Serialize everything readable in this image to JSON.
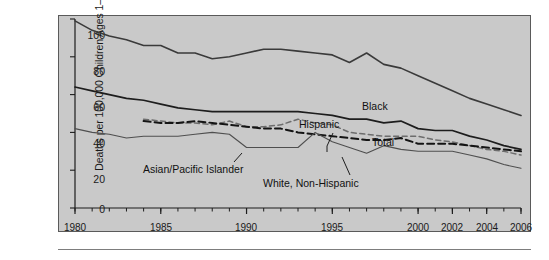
{
  "figure": {
    "background_color": "#c9c9c9",
    "border_color": "#5a5a5a",
    "rule_color": "#7d7d7d"
  },
  "axes": {
    "ylabel": "Deaths per 100,000 Children Ages 1–4",
    "yticks": [
      "0",
      "20",
      "40",
      "60",
      "80",
      "100"
    ],
    "xticks": [
      "1980",
      "1985",
      "1990",
      "1995",
      "2000",
      "2002",
      "2004",
      "2006"
    ]
  },
  "annotations": {
    "black": "Black",
    "hispanic": "Hispanic",
    "total": "Total",
    "asian_pacific_islander": "Asian/Pacific Islander",
    "white_non_hispanic": "White, Non-Hispanic"
  },
  "chart_data": {
    "type": "line",
    "title": "",
    "xlabel": "",
    "ylabel": "Deaths per 100,000 Children Ages 1–4",
    "xlim": [
      1980,
      2006
    ],
    "ylim": [
      0,
      100
    ],
    "xticks": [
      1980,
      1985,
      1990,
      1995,
      2000,
      2002,
      2004,
      2006
    ],
    "yticks": [
      0,
      20,
      40,
      60,
      80,
      100
    ],
    "xtick_minor_step": 1,
    "grid": false,
    "legend_position": "inline-annotations",
    "series": [
      {
        "name": "Black",
        "style": "solid",
        "color": "#3a3a3a",
        "width": 1.6,
        "x": [
          1980,
          1981,
          1982,
          1983,
          1984,
          1985,
          1986,
          1987,
          1988,
          1989,
          1990,
          1991,
          1992,
          1993,
          1994,
          1995,
          1996,
          1997,
          1998,
          1999,
          2000,
          2001,
          2002,
          2003,
          2004,
          2005,
          2006
        ],
        "values": [
          99,
          94,
          91,
          89,
          86,
          86,
          82,
          82,
          79,
          80,
          82,
          84,
          84,
          83,
          82,
          81,
          77,
          82,
          76,
          74,
          70,
          66,
          62,
          58,
          55,
          52,
          49
        ]
      },
      {
        "name": "Total",
        "style": "solid",
        "color": "#1d1d1d",
        "width": 1.7,
        "x": [
          1980,
          1981,
          1982,
          1983,
          1984,
          1985,
          1986,
          1987,
          1988,
          1989,
          1990,
          1991,
          1992,
          1993,
          1994,
          1995,
          1996,
          1997,
          1998,
          1999,
          2000,
          2001,
          2002,
          2003,
          2004,
          2005,
          2006
        ],
        "values": [
          64,
          62,
          60,
          58,
          57,
          55,
          53,
          52,
          51,
          51,
          51,
          51,
          51,
          51,
          50,
          49,
          47,
          47,
          45,
          46,
          42,
          41,
          41,
          38,
          36,
          33,
          31
        ]
      },
      {
        "name": "Hispanic",
        "style": "dashed-light",
        "color": "#6d6d6d",
        "width": 1.5,
        "x": [
          1984,
          1985,
          1986,
          1987,
          1988,
          1989,
          1990,
          1991,
          1992,
          1993,
          1994,
          1995,
          1996,
          1997,
          1998,
          1999,
          2000,
          2001,
          2002,
          2003,
          2004,
          2005,
          2006
        ],
        "values": [
          47,
          46,
          45,
          45,
          44,
          46,
          43,
          43,
          44,
          47,
          45,
          44,
          40,
          39,
          38,
          38,
          38,
          36,
          35,
          33,
          31,
          30,
          28
        ]
      },
      {
        "name": "White, Non-Hispanic",
        "style": "dashed-dark",
        "color": "#141414",
        "width": 2.0,
        "x": [
          1984,
          1985,
          1986,
          1987,
          1988,
          1989,
          1990,
          1991,
          1992,
          1993,
          1994,
          1995,
          1996,
          1997,
          1998,
          1999,
          2000,
          2001,
          2002,
          2003,
          2004,
          2005,
          2006
        ],
        "values": [
          46,
          45,
          45,
          46,
          45,
          44,
          43,
          42,
          42,
          40,
          39,
          38,
          37,
          36,
          36,
          37,
          34,
          34,
          34,
          33,
          32,
          31,
          30
        ]
      },
      {
        "name": "Asian/Pacific Islander",
        "style": "solid-thin",
        "color": "#4f4f4f",
        "width": 1.1,
        "x": [
          1980,
          1981,
          1982,
          1983,
          1984,
          1985,
          1986,
          1987,
          1988,
          1989,
          1990,
          1991,
          1992,
          1993,
          1994,
          1995,
          1996,
          1997,
          1998,
          1999,
          2000,
          2001,
          2002,
          2003,
          2004,
          2005,
          2006
        ],
        "values": [
          42,
          40,
          39,
          37,
          38,
          38,
          38,
          39,
          40,
          39,
          32,
          32,
          32,
          32,
          40,
          35,
          32,
          29,
          33,
          31,
          30,
          30,
          30,
          28,
          26,
          23,
          21
        ]
      }
    ]
  }
}
